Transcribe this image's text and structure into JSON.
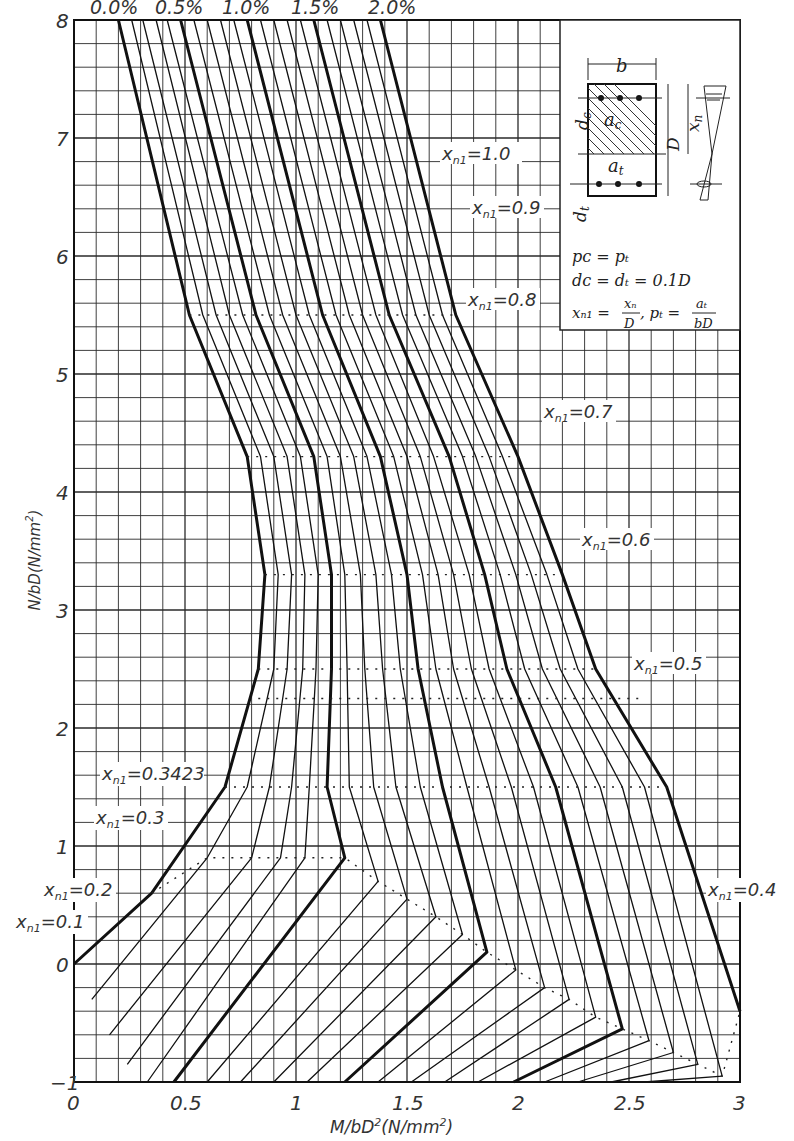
{
  "chart_data": {
    "type": "line",
    "title": "",
    "xlabel": "M/bD²(N/mm²)",
    "ylabel": "N/bD(N/mm²)",
    "xlim": [
      0,
      3
    ],
    "ylim": [
      -1,
      8
    ],
    "x_ticks": [
      "0",
      "0.5",
      "1",
      "1.5",
      "2",
      "2.5",
      "3"
    ],
    "y_ticks": [
      "−1",
      "0",
      "1",
      "2",
      "3",
      "4",
      "5",
      "6",
      "7",
      "8"
    ],
    "grid": true,
    "grid_spacing": {
      "x": 0.1,
      "y": 0.2
    },
    "legend_position": "top",
    "series_labels_top": [
      "0.0%",
      "0.5%",
      "1.0%",
      "1.5%",
      "2.0%"
    ],
    "series": [
      {
        "name": "0.0%",
        "bold": true,
        "points": [
          [
            0.2,
            8.0
          ],
          [
            0.52,
            5.5
          ],
          [
            0.78,
            4.3
          ],
          [
            0.86,
            3.3
          ],
          [
            0.83,
            2.5
          ],
          [
            0.68,
            1.5
          ],
          [
            0.35,
            0.6
          ],
          [
            0.0,
            0.0
          ]
        ]
      },
      {
        "name": "0.1%",
        "bold": false,
        "points": [
          [
            0.26,
            8.0
          ],
          [
            0.58,
            5.5
          ],
          [
            0.84,
            4.3
          ],
          [
            0.92,
            3.3
          ],
          [
            0.9,
            2.5
          ],
          [
            0.78,
            1.5
          ],
          [
            0.6,
            0.9
          ],
          [
            0.08,
            -0.3
          ]
        ]
      },
      {
        "name": "0.2%",
        "bold": false,
        "points": [
          [
            0.31,
            8.0
          ],
          [
            0.64,
            5.5
          ],
          [
            0.9,
            4.3
          ],
          [
            0.98,
            3.3
          ],
          [
            0.96,
            2.5
          ],
          [
            0.88,
            1.5
          ],
          [
            0.8,
            0.9
          ],
          [
            0.16,
            -0.6
          ]
        ]
      },
      {
        "name": "0.3%",
        "bold": false,
        "points": [
          [
            0.37,
            8.0
          ],
          [
            0.7,
            5.5
          ],
          [
            0.96,
            4.3
          ],
          [
            1.04,
            3.3
          ],
          [
            1.03,
            2.5
          ],
          [
            0.98,
            1.5
          ],
          [
            0.93,
            0.9
          ],
          [
            0.24,
            -0.85
          ]
        ]
      },
      {
        "name": "0.4%",
        "bold": false,
        "points": [
          [
            0.42,
            8.0
          ],
          [
            0.76,
            5.5
          ],
          [
            1.02,
            4.3
          ],
          [
            1.1,
            3.3
          ],
          [
            1.09,
            2.5
          ],
          [
            1.06,
            1.5
          ],
          [
            1.04,
            0.9
          ],
          [
            0.33,
            -1.0
          ]
        ]
      },
      {
        "name": "0.5%",
        "bold": true,
        "points": [
          [
            0.48,
            8.0
          ],
          [
            0.82,
            5.5
          ],
          [
            1.08,
            4.3
          ],
          [
            1.16,
            3.3
          ],
          [
            1.16,
            2.5
          ],
          [
            1.14,
            1.5
          ],
          [
            1.22,
            0.9
          ],
          [
            0.45,
            -1.0
          ]
        ]
      },
      {
        "name": "0.6%",
        "bold": false,
        "points": [
          [
            0.54,
            8.0
          ],
          [
            0.88,
            5.5
          ],
          [
            1.14,
            4.3
          ],
          [
            1.22,
            3.3
          ],
          [
            1.23,
            2.5
          ],
          [
            1.24,
            1.5
          ],
          [
            1.37,
            0.7
          ],
          [
            0.6,
            -1.0
          ]
        ]
      },
      {
        "name": "0.7%",
        "bold": false,
        "points": [
          [
            0.6,
            8.0
          ],
          [
            0.94,
            5.5
          ],
          [
            1.2,
            4.3
          ],
          [
            1.29,
            3.3
          ],
          [
            1.31,
            2.5
          ],
          [
            1.35,
            1.5
          ],
          [
            1.5,
            0.55
          ],
          [
            0.75,
            -1.0
          ]
        ]
      },
      {
        "name": "0.8%",
        "bold": false,
        "points": [
          [
            0.66,
            8.0
          ],
          [
            1.0,
            5.5
          ],
          [
            1.26,
            4.3
          ],
          [
            1.36,
            3.3
          ],
          [
            1.39,
            2.5
          ],
          [
            1.45,
            1.5
          ],
          [
            1.63,
            0.4
          ],
          [
            0.9,
            -1.0
          ]
        ]
      },
      {
        "name": "0.9%",
        "bold": false,
        "points": [
          [
            0.72,
            8.0
          ],
          [
            1.06,
            5.5
          ],
          [
            1.32,
            4.3
          ],
          [
            1.43,
            3.3
          ],
          [
            1.47,
            2.5
          ],
          [
            1.56,
            1.5
          ],
          [
            1.75,
            0.25
          ],
          [
            1.05,
            -1.0
          ]
        ]
      },
      {
        "name": "1.0%",
        "bold": true,
        "points": [
          [
            0.78,
            8.0
          ],
          [
            1.12,
            5.5
          ],
          [
            1.38,
            4.3
          ],
          [
            1.5,
            3.3
          ],
          [
            1.55,
            2.5
          ],
          [
            1.66,
            1.5
          ],
          [
            1.86,
            0.1
          ],
          [
            1.22,
            -1.0
          ]
        ]
      },
      {
        "name": "1.1%",
        "bold": false,
        "points": [
          [
            0.84,
            8.0
          ],
          [
            1.18,
            5.5
          ],
          [
            1.44,
            4.3
          ],
          [
            1.57,
            3.3
          ],
          [
            1.63,
            2.5
          ],
          [
            1.77,
            1.5
          ],
          [
            1.99,
            -0.05
          ],
          [
            1.37,
            -1.0
          ]
        ]
      },
      {
        "name": "1.2%",
        "bold": false,
        "points": [
          [
            0.9,
            8.0
          ],
          [
            1.24,
            5.5
          ],
          [
            1.5,
            4.3
          ],
          [
            1.64,
            3.3
          ],
          [
            1.71,
            2.5
          ],
          [
            1.87,
            1.5
          ],
          [
            2.12,
            -0.2
          ],
          [
            1.52,
            -1.0
          ]
        ]
      },
      {
        "name": "1.3%",
        "bold": false,
        "points": [
          [
            0.96,
            8.0
          ],
          [
            1.3,
            5.5
          ],
          [
            1.56,
            4.3
          ],
          [
            1.71,
            3.3
          ],
          [
            1.79,
            2.5
          ],
          [
            1.97,
            1.5
          ],
          [
            2.23,
            -0.3
          ],
          [
            1.67,
            -1.0
          ]
        ]
      },
      {
        "name": "1.4%",
        "bold": false,
        "points": [
          [
            1.02,
            8.0
          ],
          [
            1.36,
            5.5
          ],
          [
            1.62,
            4.3
          ],
          [
            1.78,
            3.3
          ],
          [
            1.87,
            2.5
          ],
          [
            2.07,
            1.5
          ],
          [
            2.35,
            -0.45
          ],
          [
            1.82,
            -1.0
          ]
        ]
      },
      {
        "name": "1.5%",
        "bold": true,
        "points": [
          [
            1.08,
            8.0
          ],
          [
            1.42,
            5.5
          ],
          [
            1.69,
            4.3
          ],
          [
            1.85,
            3.3
          ],
          [
            1.95,
            2.5
          ],
          [
            2.17,
            1.5
          ],
          [
            2.47,
            -0.55
          ],
          [
            1.98,
            -1.0
          ]
        ]
      },
      {
        "name": "1.6%",
        "bold": false,
        "points": [
          [
            1.14,
            8.0
          ],
          [
            1.48,
            5.5
          ],
          [
            1.75,
            4.3
          ],
          [
            1.92,
            3.3
          ],
          [
            2.03,
            2.5
          ],
          [
            2.27,
            1.5
          ],
          [
            2.59,
            -0.65
          ],
          [
            2.12,
            -1.0
          ]
        ]
      },
      {
        "name": "1.7%",
        "bold": false,
        "points": [
          [
            1.2,
            8.0
          ],
          [
            1.54,
            5.5
          ],
          [
            1.81,
            4.3
          ],
          [
            1.99,
            3.3
          ],
          [
            2.11,
            2.5
          ],
          [
            2.37,
            1.5
          ],
          [
            2.7,
            -0.75
          ],
          [
            2.27,
            -1.0
          ]
        ]
      },
      {
        "name": "1.8%",
        "bold": false,
        "points": [
          [
            1.26,
            8.0
          ],
          [
            1.6,
            5.5
          ],
          [
            1.87,
            4.3
          ],
          [
            2.06,
            3.3
          ],
          [
            2.19,
            2.5
          ],
          [
            2.47,
            1.5
          ],
          [
            2.81,
            -0.85
          ],
          [
            2.42,
            -1.0
          ]
        ]
      },
      {
        "name": "1.9%",
        "bold": false,
        "points": [
          [
            1.32,
            8.0
          ],
          [
            1.66,
            5.5
          ],
          [
            1.93,
            4.3
          ],
          [
            2.13,
            3.3
          ],
          [
            2.27,
            2.5
          ],
          [
            2.57,
            1.5
          ],
          [
            2.92,
            -0.95
          ],
          [
            2.57,
            -1.0
          ]
        ]
      },
      {
        "name": "2.0%",
        "bold": true,
        "points": [
          [
            1.38,
            8.0
          ],
          [
            1.72,
            5.5
          ],
          [
            2.0,
            4.3
          ],
          [
            2.2,
            3.3
          ],
          [
            2.35,
            2.5
          ],
          [
            2.67,
            1.5
          ],
          [
            3.0,
            -0.4
          ]
        ]
      }
    ],
    "xn1_lines": [
      {
        "label": "xₙ₁=0.1",
        "label_pos": [
          -0.05,
          -0.05
        ]
      },
      {
        "label": "xₙ₁=0.2",
        "label_pos": [
          0.0,
          0.3
        ]
      },
      {
        "label": "xₙ₁=0.3",
        "label_pos": [
          0.1,
          1.0
        ]
      },
      {
        "label": "xₙ₁=0.3423",
        "label_pos": [
          0.15,
          1.5
        ]
      },
      {
        "label": "xₙ₁=0.4",
        "label_pos": [
          2.9,
          0.3
        ]
      },
      {
        "label": "xₙ₁=0.5",
        "label_pos": [
          2.55,
          2.2
        ]
      },
      {
        "label": "xₙ₁=0.6",
        "label_pos": [
          2.3,
          3.4
        ]
      },
      {
        "label": "xₙ₁=0.7",
        "label_pos": [
          2.1,
          4.4
        ]
      },
      {
        "label": "xₙ₁=0.8",
        "label_pos": [
          1.8,
          5.6
        ]
      },
      {
        "label": "xₙ₁=0.9",
        "label_pos": [
          1.75,
          6.4
        ]
      },
      {
        "label": "xₙ₁=1.0",
        "label_pos": [
          1.7,
          7.3
        ]
      }
    ],
    "annotations": [
      "p_c = p_t",
      "d_c = d_t = 0.1D",
      "x_n1 = x_n / D,  p_t = a_t / bD"
    ]
  },
  "labels": {
    "pct": [
      "0.0%",
      "0.5%",
      "1.0%",
      "1.5%",
      "2.0%"
    ],
    "xticks": [
      "0",
      "0.5",
      "1",
      "1.5",
      "2",
      "2.5",
      "3"
    ],
    "yticks": [
      "−1",
      "0",
      "1",
      "2",
      "3",
      "4",
      "5",
      "6",
      "7",
      "8"
    ],
    "xlabel_main": "M/bD",
    "xlabel_sup": "2",
    "xlabel_unit": "(N/mm",
    "xlabel_unit_sup": "2",
    "xlabel_close": ")",
    "ylabel_main": "N/bD(N/mm",
    "ylabel_sup": "2",
    "ylabel_close": ")",
    "xn1": {
      "v01": "=0.1",
      "v02": "=0.2",
      "v03": "=0.3",
      "v03423": "=0.3423",
      "v04": "=0.4",
      "v05": "=0.5",
      "v06": "=0.6",
      "v07": "=0.7",
      "v08": "=0.8",
      "v09": "=0.9",
      "v10": "=1.0"
    },
    "inset": {
      "b": "b",
      "dc": "d",
      "dc_sub": "c",
      "dt": "d",
      "dt_sub": "t",
      "ac": "a",
      "ac_sub": "c",
      "at": "a",
      "at_sub": "t",
      "D": "D",
      "xn": "x",
      "xn_sub": "n",
      "eq1": "pᴄ = pₜ",
      "eq2": "dᴄ = dₜ = 0.1D",
      "eq3a": "xₙ₁ =",
      "eq3_num": "xₙ",
      "eq3_den": "D",
      "eq3b": ",  pₜ =",
      "eq3_num2": "aₜ",
      "eq3_den2": "bD"
    }
  },
  "colors": {
    "grid": "#2a2a2a",
    "curve": "#111111",
    "background": "#ffffff"
  }
}
